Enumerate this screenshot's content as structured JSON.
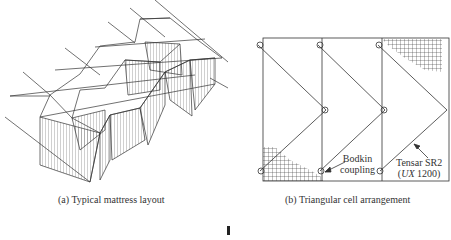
{
  "figure": {
    "panel_a": {
      "caption": "(a) Typical mattress layout"
    },
    "panel_b": {
      "caption": "(b) Triangular cell arrangement",
      "labels": {
        "bodkin_line1": "Bodkin",
        "bodkin_line2": "coupling",
        "tensar_line1": "Tensar SR2",
        "tensar_line2_italic": "UX",
        "tensar_line2_rest": " 1200)",
        "tensar_line2_open": "("
      }
    }
  },
  "colors": {
    "line": "#333333",
    "background": "#ffffff"
  }
}
